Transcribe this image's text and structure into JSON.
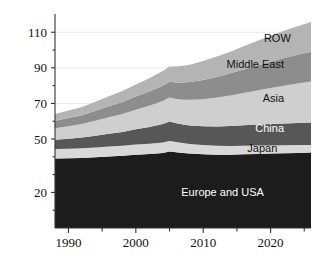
{
  "chart_data": {
    "type": "area",
    "title": "",
    "subtitle": "",
    "xlabel": "",
    "ylabel": "",
    "stacked": true,
    "grid": true,
    "legend_position": "inline-right",
    "xlim": [
      1988,
      2026
    ],
    "ylim": [
      0,
      118
    ],
    "x": [
      1988,
      1990,
      1992,
      1994,
      1996,
      1998,
      2000,
      2002,
      2004,
      2005,
      2006,
      2007,
      2008,
      2010,
      2012,
      2014,
      2016,
      2018,
      2020,
      2022,
      2024,
      2026
    ],
    "xticks": [
      1990,
      2000,
      2010,
      2020
    ],
    "xticks_minor": [
      1985,
      1995,
      2005,
      2015,
      2025
    ],
    "yticks": [
      20,
      50,
      70,
      90,
      110
    ],
    "yticks_minor": [
      10,
      30,
      40,
      60,
      80,
      100
    ],
    "series": [
      {
        "name": "Europe and USA",
        "color": "#1c1c1c",
        "label_color": "#ffffff",
        "values": [
          39.0,
          39.2,
          39.4,
          39.8,
          40.2,
          40.6,
          41.2,
          41.6,
          42.2,
          43.0,
          42.6,
          42.2,
          41.8,
          41.4,
          41.2,
          41.2,
          41.4,
          41.6,
          41.8,
          42.0,
          42.2,
          42.4
        ]
      },
      {
        "name": "Japan",
        "color": "#d8d8d8",
        "label_color": "#111111",
        "values": [
          5.4,
          5.4,
          5.4,
          5.5,
          5.6,
          5.6,
          5.7,
          5.7,
          5.8,
          5.9,
          5.7,
          5.5,
          5.4,
          5.2,
          5.0,
          4.9,
          4.8,
          4.7,
          4.6,
          4.5,
          4.4,
          4.3
        ]
      },
      {
        "name": "China",
        "color": "#575757",
        "label_color": "#ffffff",
        "values": [
          5.2,
          5.6,
          6.0,
          6.6,
          7.2,
          7.8,
          8.6,
          9.4,
          10.4,
          11.0,
          10.6,
          10.4,
          10.4,
          10.6,
          10.9,
          11.2,
          11.5,
          11.8,
          12.0,
          12.2,
          12.4,
          12.6
        ]
      },
      {
        "name": "Asia",
        "color": "#cfcfcf",
        "label_color": "#111111",
        "values": [
          6.4,
          7.0,
          7.6,
          8.4,
          9.2,
          10.0,
          11.0,
          12.0,
          13.0,
          13.4,
          13.6,
          14.0,
          14.4,
          15.2,
          16.2,
          17.2,
          18.2,
          19.2,
          20.2,
          21.2,
          22.2,
          23.0
        ]
      },
      {
        "name": "Middle East",
        "color": "#8d8d8d",
        "label_color": "#111111",
        "values": [
          4.2,
          4.6,
          5.0,
          5.6,
          6.2,
          6.8,
          7.4,
          8.0,
          8.6,
          8.9,
          9.2,
          9.6,
          10.0,
          10.8,
          11.6,
          12.4,
          13.2,
          14.0,
          14.8,
          15.6,
          16.2,
          16.8
        ]
      },
      {
        "name": "ROW",
        "color": "#b4b4b4",
        "label_color": "#111111",
        "values": [
          3.8,
          4.2,
          4.6,
          5.0,
          5.6,
          6.2,
          6.8,
          7.4,
          8.2,
          8.6,
          9.0,
          9.4,
          9.8,
          10.6,
          11.4,
          12.2,
          13.0,
          13.8,
          14.6,
          15.4,
          16.0,
          16.6
        ]
      }
    ],
    "series_label_positions": [
      {
        "name": "Europe and USA",
        "x": 2019,
        "y": 20
      },
      {
        "name": "Japan",
        "x": 2021,
        "y": 45
      },
      {
        "name": "China",
        "x": 2022,
        "y": 56
      },
      {
        "name": "Asia",
        "x": 2022,
        "y": 73
      },
      {
        "name": "Middle East",
        "x": 2022,
        "y": 92
      },
      {
        "name": "ROW",
        "x": 2023,
        "y": 107
      }
    ]
  }
}
